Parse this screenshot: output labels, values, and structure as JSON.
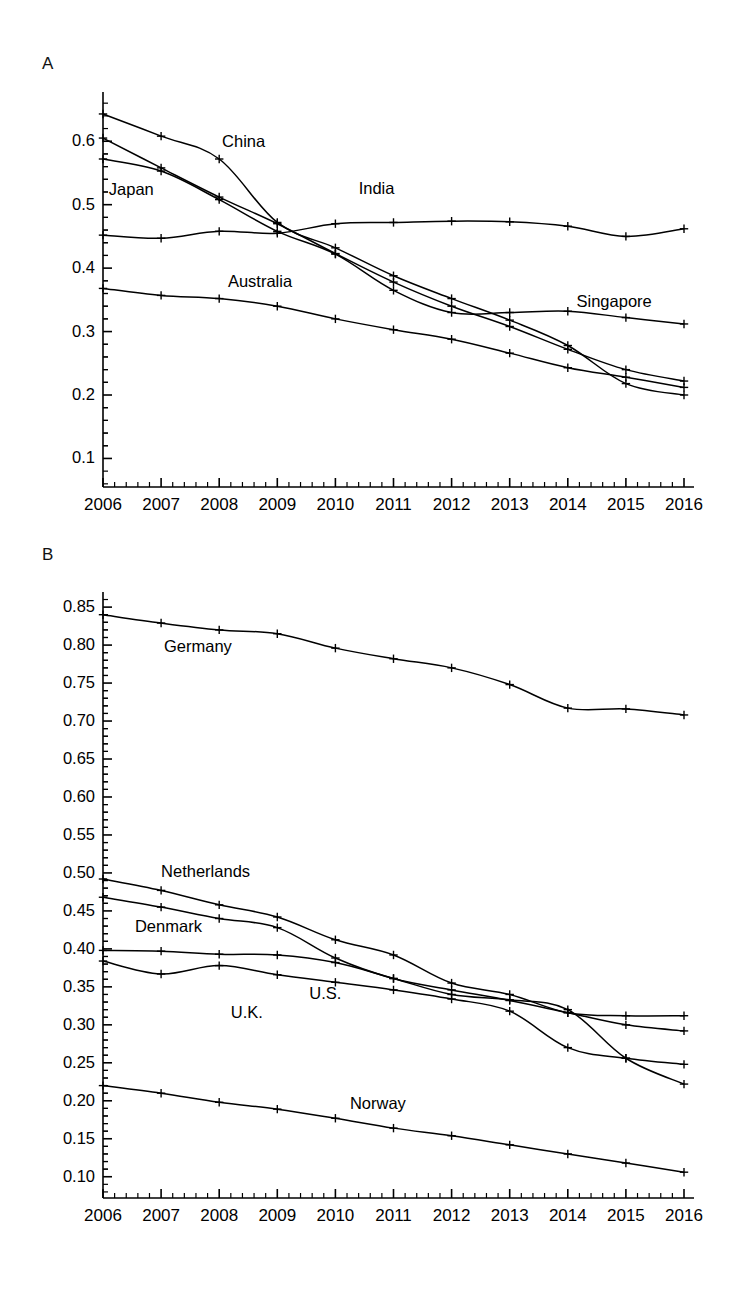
{
  "figure": {
    "panels": [
      {
        "letter": "A"
      },
      {
        "letter": "B"
      }
    ]
  },
  "chart_data": [
    {
      "type": "line",
      "panel": "A",
      "title": "",
      "xlabel": "",
      "ylabel": "",
      "x": [
        2006,
        2007,
        2008,
        2009,
        2010,
        2011,
        2012,
        2013,
        2014,
        2015,
        2016
      ],
      "xticklabels": [
        "2006",
        "2007",
        "2008",
        "2009",
        "2010",
        "2011",
        "2012",
        "2013",
        "2014",
        "2015",
        "2016"
      ],
      "yticklabels": [
        "0.1",
        "0.2",
        "0.3",
        "0.4",
        "0.5",
        "0.6"
      ],
      "ytickvalues": [
        0.1,
        0.2,
        0.3,
        0.4,
        0.5,
        0.6
      ],
      "xlim": [
        2006,
        2016
      ],
      "ylim": [
        0.055,
        0.665
      ],
      "grid": false,
      "minor_ticks_per_interval": 5,
      "legend": "inline-labels",
      "marker": "plus",
      "series": [
        {
          "name": "China",
          "label": "China",
          "label_x": 2008.05,
          "label_y": 0.598,
          "values": [
            0.643,
            0.608,
            0.572,
            0.472,
            0.432,
            0.388,
            0.352,
            0.318,
            0.278,
            0.218,
            0.2
          ]
        },
        {
          "name": "Japan",
          "label": "Japan",
          "label_x": 2006.1,
          "label_y": 0.522,
          "values": [
            0.605,
            0.558,
            0.512,
            0.47,
            0.423,
            0.378,
            0.34,
            0.308,
            0.272,
            0.24,
            0.222
          ]
        },
        {
          "name": "India",
          "label": "India",
          "label_x": 2010.4,
          "label_y": 0.523,
          "values": [
            0.452,
            0.447,
            0.458,
            0.455,
            0.47,
            0.472,
            0.474,
            0.473,
            0.466,
            0.45,
            0.462
          ]
        },
        {
          "name": "Australia",
          "label": "Australia",
          "label_x": 2008.15,
          "label_y": 0.377,
          "values": [
            0.368,
            0.357,
            0.352,
            0.34,
            0.32,
            0.303,
            0.288,
            0.266,
            0.243,
            0.228,
            0.212
          ]
        },
        {
          "name": "Singapore",
          "label": "Singapore",
          "label_x": 2014.15,
          "label_y": 0.345,
          "values": [
            0.572,
            0.553,
            0.508,
            0.458,
            0.422,
            0.365,
            0.33,
            0.33,
            0.332,
            0.322,
            0.312
          ]
        }
      ]
    },
    {
      "type": "line",
      "panel": "B",
      "title": "",
      "xlabel": "",
      "ylabel": "",
      "x": [
        2006,
        2007,
        2008,
        2009,
        2010,
        2011,
        2012,
        2013,
        2014,
        2015,
        2016
      ],
      "xticklabels": [
        "2006",
        "2007",
        "2008",
        "2009",
        "2010",
        "2011",
        "2012",
        "2013",
        "2014",
        "2015",
        "2016"
      ],
      "yticklabels": [
        "0.10",
        "0.15",
        "0.20",
        "0.25",
        "0.30",
        "0.35",
        "0.40",
        "0.45",
        "0.50",
        "0.55",
        "0.60",
        "0.65",
        "0.70",
        "0.75",
        "0.80",
        "0.85"
      ],
      "ytickvalues": [
        0.1,
        0.15,
        0.2,
        0.25,
        0.3,
        0.35,
        0.4,
        0.45,
        0.5,
        0.55,
        0.6,
        0.65,
        0.7,
        0.75,
        0.8,
        0.85
      ],
      "xlim": [
        2006,
        2016
      ],
      "ylim": [
        0.072,
        0.862
      ],
      "grid": false,
      "minor_ticks_per_interval": 5,
      "legend": "inline-labels",
      "marker": "plus",
      "series": [
        {
          "name": "Germany",
          "label": "Germany",
          "label_x": 2007.05,
          "label_y": 0.796,
          "values": [
            0.84,
            0.829,
            0.82,
            0.815,
            0.796,
            0.782,
            0.77,
            0.748,
            0.717,
            0.716,
            0.708
          ]
        },
        {
          "name": "Netherlands",
          "label": "Netherlands",
          "label_x": 2007.0,
          "label_y": 0.5,
          "values": [
            0.492,
            0.477,
            0.458,
            0.442,
            0.412,
            0.392,
            0.355,
            0.34,
            0.316,
            0.312,
            0.312
          ]
        },
        {
          "name": "Denmark",
          "label": "Denmark",
          "label_x": 2006.55,
          "label_y": 0.428,
          "values": [
            0.468,
            0.455,
            0.44,
            0.428,
            0.388,
            0.361,
            0.346,
            0.332,
            0.316,
            0.3,
            0.292
          ]
        },
        {
          "name": "U.S.",
          "label": "U.S.",
          "label_x": 2009.55,
          "label_y": 0.339,
          "values": [
            0.398,
            0.397,
            0.393,
            0.392,
            0.382,
            0.361,
            0.34,
            0.333,
            0.32,
            0.256,
            0.222
          ]
        },
        {
          "name": "U.K.",
          "label": "U.K.",
          "label_x": 2008.2,
          "label_y": 0.314,
          "values": [
            0.384,
            0.367,
            0.378,
            0.366,
            0.356,
            0.346,
            0.334,
            0.318,
            0.27,
            0.256,
            0.248
          ]
        },
        {
          "name": "Norway",
          "label": "Norway",
          "label_x": 2010.25,
          "label_y": 0.194,
          "values": [
            0.22,
            0.21,
            0.198,
            0.189,
            0.177,
            0.164,
            0.154,
            0.142,
            0.13,
            0.118,
            0.106
          ]
        }
      ]
    }
  ]
}
